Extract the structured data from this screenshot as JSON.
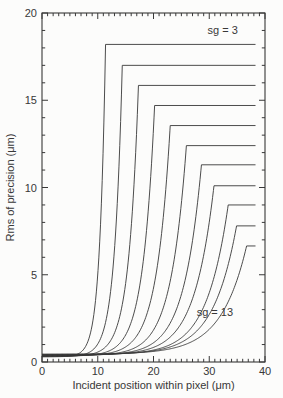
{
  "figure": {
    "background_color": "#fcfcfb",
    "line_color": "#383838",
    "text_color": "#383838"
  },
  "chart_data": {
    "type": "line",
    "title": "",
    "xlabel": "Incident position within pixel (μm)",
    "ylabel": "Rms of precision (μm)",
    "xlim": [
      0,
      40
    ],
    "ylim": [
      0,
      20
    ],
    "x_major_ticks": [
      0,
      10,
      20,
      30,
      40
    ],
    "x_minor_step": 1,
    "y_major_ticks": [
      0,
      5,
      10,
      15,
      20
    ],
    "y_minor_step": 1,
    "grid": false,
    "legend": "none",
    "tick_style": "inward, drawn on all four box sides",
    "annotations": [
      {
        "id": "sg-3",
        "text": "sg = 3",
        "x": 32.4,
        "y": 18.8
      },
      {
        "id": "sg-13",
        "text": "sg = 13",
        "x": 31.0,
        "y": 2.64
      }
    ],
    "series_model": "y(x) = base + (plateau - base) * exp((x - knee_x) / rise_scale) for x < knee_x, then constant y = plateau from knee_x to x_end",
    "series": [
      {
        "name": "sg = 3",
        "sg": 3,
        "plateau": 18.2,
        "knee_x": 11.4,
        "rise_scale": 1.05,
        "base": 0.3,
        "x_end": 38.3
      },
      {
        "name": "sg = 4",
        "sg": 4,
        "plateau": 17.0,
        "knee_x": 14.4,
        "rise_scale": 1.4,
        "base": 0.31,
        "x_end": 38.3
      },
      {
        "name": "sg = 5",
        "sg": 5,
        "plateau": 15.85,
        "knee_x": 17.3,
        "rise_scale": 1.75,
        "base": 0.33,
        "x_end": 38.3
      },
      {
        "name": "sg = 6",
        "sg": 6,
        "plateau": 14.7,
        "knee_x": 20.2,
        "rise_scale": 2.1,
        "base": 0.34,
        "x_end": 38.3
      },
      {
        "name": "sg = 7",
        "sg": 7,
        "plateau": 13.55,
        "knee_x": 23.0,
        "rise_scale": 2.45,
        "base": 0.36,
        "x_end": 38.3
      },
      {
        "name": "sg = 8",
        "sg": 8,
        "plateau": 12.4,
        "knee_x": 25.9,
        "rise_scale": 2.8,
        "base": 0.37,
        "x_end": 38.3
      },
      {
        "name": "sg = 9",
        "sg": 9,
        "plateau": 11.3,
        "knee_x": 28.6,
        "rise_scale": 3.15,
        "base": 0.39,
        "x_end": 38.3
      },
      {
        "name": "sg = 10",
        "sg": 10,
        "plateau": 10.1,
        "knee_x": 30.85,
        "rise_scale": 3.5,
        "base": 0.4,
        "x_end": 38.3
      },
      {
        "name": "sg = 11",
        "sg": 11,
        "plateau": 9.0,
        "knee_x": 33.4,
        "rise_scale": 3.85,
        "base": 0.42,
        "x_end": 38.3
      },
      {
        "name": "sg = 12",
        "sg": 12,
        "plateau": 7.8,
        "knee_x": 34.9,
        "rise_scale": 4.2,
        "base": 0.43,
        "x_end": 38.3
      },
      {
        "name": "sg = 13",
        "sg": 13,
        "plateau": 6.65,
        "knee_x": 36.7,
        "rise_scale": 4.55,
        "base": 0.45,
        "x_end": 38.3
      }
    ]
  }
}
